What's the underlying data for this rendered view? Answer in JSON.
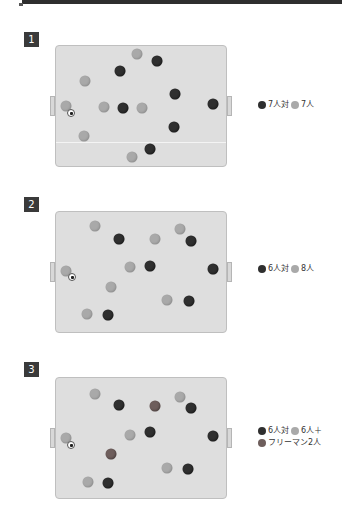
{
  "header": {
    "strip": ""
  },
  "colors": {
    "dark": "#2f2f2f",
    "light": "#a9a9a9",
    "free": "#6e5e5c",
    "field": "#dedede",
    "badge": "#3a3a3a"
  },
  "panels": [
    {
      "number": "1",
      "legend": {
        "team_a": "7人対",
        "team_b": "7人",
        "extra": ""
      },
      "dark": [
        [
          120,
          71
        ],
        [
          157,
          61
        ],
        [
          175,
          94
        ],
        [
          123,
          108
        ],
        [
          213,
          104
        ],
        [
          174,
          127
        ],
        [
          150,
          149
        ]
      ],
      "light": [
        [
          137,
          54
        ],
        [
          85,
          81
        ],
        [
          66,
          106
        ],
        [
          104,
          107
        ],
        [
          142,
          108
        ],
        [
          84,
          136
        ],
        [
          132,
          157
        ]
      ],
      "mid": [],
      "ball": [
        71,
        113
      ]
    },
    {
      "number": "2",
      "legend": {
        "team_a": "6人対",
        "team_b": "8人",
        "extra": ""
      },
      "dark": [
        [
          119,
          239
        ],
        [
          191,
          241
        ],
        [
          150,
          266
        ],
        [
          213,
          269
        ],
        [
          189,
          301
        ],
        [
          108,
          315
        ]
      ],
      "light": [
        [
          95,
          226
        ],
        [
          155,
          239
        ],
        [
          180,
          229
        ],
        [
          130,
          267
        ],
        [
          111,
          287
        ],
        [
          167,
          300
        ],
        [
          87,
          314
        ],
        [
          66,
          271
        ]
      ],
      "mid": [],
      "ball": [
        72,
        277
      ]
    },
    {
      "number": "3",
      "legend": {
        "team_a": "6人対",
        "team_b": "6人＋",
        "extra": "フリーマン2人"
      },
      "dark": [
        [
          119,
          405
        ],
        [
          191,
          408
        ],
        [
          150,
          432
        ],
        [
          213,
          436
        ],
        [
          188,
          469
        ],
        [
          108,
          483
        ]
      ],
      "light": [
        [
          95,
          394
        ],
        [
          180,
          397
        ],
        [
          130,
          435
        ],
        [
          88,
          482
        ],
        [
          167,
          468
        ],
        [
          66,
          438
        ]
      ],
      "mid": [
        [
          155,
          406
        ],
        [
          111,
          454
        ]
      ],
      "ball": [
        71,
        445
      ]
    }
  ]
}
